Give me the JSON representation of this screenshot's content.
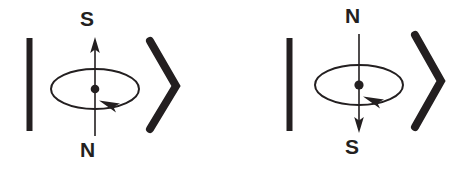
{
  "figure": {
    "type": "physics-diagram",
    "ink_color": "#231f20",
    "background_color": "#ffffff",
    "panel_count": 2
  },
  "panels": [
    {
      "id": "left-panel",
      "top_label": "S",
      "bottom_label": "N",
      "axis_arrow_direction": "up",
      "spin_arrowhead_direction": "left",
      "spin_sense": "clockwise-viewed-from-above",
      "left_bracket_glyph": "|",
      "right_bracket_glyph": ">",
      "center_dot": true
    },
    {
      "id": "right-panel",
      "top_label": "N",
      "bottom_label": "S",
      "axis_arrow_direction": "down",
      "spin_arrowhead_direction": "left",
      "spin_sense": "clockwise-viewed-from-above",
      "left_bracket_glyph": "|",
      "right_bracket_glyph": ">",
      "center_dot": true
    }
  ]
}
